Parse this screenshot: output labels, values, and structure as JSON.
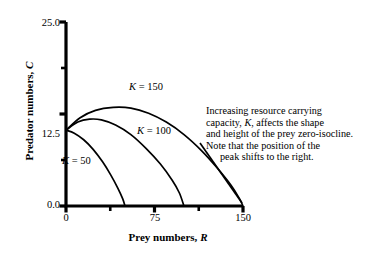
{
  "chart_data": {
    "type": "line",
    "title": "",
    "xlabel": "Prey numbers, R",
    "ylabel": "Predator numbers, C",
    "xlim": [
      0,
      150
    ],
    "ylim": [
      0,
      25.0
    ],
    "grid": false,
    "legend_position": "inline-curve-labels",
    "x_ticks": [
      0,
      37.5,
      75,
      112.5,
      150
    ],
    "x_tick_labels": [
      "0",
      "",
      "75",
      "",
      "150"
    ],
    "y_ticks": [
      0.0,
      6.25,
      12.5,
      18.75,
      25.0
    ],
    "y_tick_labels": [
      "0.0",
      "",
      "12.5",
      "",
      "25.0"
    ],
    "y_intercept": 10.3,
    "series": [
      {
        "name": "K = 50",
        "label": "K = 50",
        "K": 50,
        "x_intercept": 50,
        "peak_x": 0,
        "peak_y": 10.3,
        "points": [
          [
            0,
            10.3
          ],
          [
            7,
            9.9
          ],
          [
            15,
            9.0
          ],
          [
            23,
            7.7
          ],
          [
            31,
            6.0
          ],
          [
            38,
            4.2
          ],
          [
            44,
            2.4
          ],
          [
            48,
            1.0
          ],
          [
            50,
            0.0
          ]
        ]
      },
      {
        "name": "K = 100",
        "label": "K = 100",
        "K": 100,
        "x_intercept": 100,
        "peak_x": 25,
        "peak_y": 11.9,
        "points": [
          [
            0,
            10.3
          ],
          [
            10,
            11.4
          ],
          [
            20,
            11.8
          ],
          [
            30,
            11.7
          ],
          [
            42,
            11.0
          ],
          [
            55,
            9.7
          ],
          [
            68,
            7.8
          ],
          [
            80,
            5.7
          ],
          [
            90,
            3.5
          ],
          [
            96,
            1.8
          ],
          [
            100,
            0.0
          ]
        ]
      },
      {
        "name": "K = 150",
        "label": "K = 150",
        "K": 150,
        "x_intercept": 150,
        "peak_x": 50,
        "peak_y": 13.4,
        "points": [
          [
            0,
            10.3
          ],
          [
            12,
            12.0
          ],
          [
            25,
            13.0
          ],
          [
            40,
            13.4
          ],
          [
            55,
            13.3
          ],
          [
            70,
            12.6
          ],
          [
            85,
            11.4
          ],
          [
            100,
            9.7
          ],
          [
            115,
            7.5
          ],
          [
            128,
            5.2
          ],
          [
            140,
            2.8
          ],
          [
            147,
            1.0
          ],
          [
            150,
            0.0
          ]
        ]
      }
    ],
    "curve_labels": [
      {
        "text": "K = 150",
        "symbol": "K",
        "rest": " = 150"
      },
      {
        "text": "K = 100",
        "symbol": "K",
        "rest": " = 100"
      },
      {
        "text": "K = 50",
        "symbol": "K",
        "rest": " = 50"
      }
    ],
    "annotation": {
      "lines": [
        "Increasing resource carrying",
        "capacity, K, affects the shape",
        "and height of the prey zero-isocline.",
        "Note that the position of the",
        "peak shifts to the right."
      ],
      "line2_prefix": "capacity, ",
      "line2_symbol": "K",
      "line2_suffix": ", affects the shape",
      "leader_line_to": [
        150,
        0
      ]
    }
  },
  "axes": {
    "y_title_prefix": "Predator numbers, ",
    "y_title_symbol": "C",
    "x_title_prefix": "Prey numbers, ",
    "x_title_symbol": "R",
    "y_label_top": "25.0",
    "y_label_mid": "12.5",
    "y_label_bottom": "0.0",
    "x_label_left": "0",
    "x_label_mid": "75",
    "x_label_right": "150"
  },
  "caption": {
    "text": ""
  },
  "colors": {
    "axis": "#000000",
    "curve": "#000000",
    "text": "#000000",
    "background": "#ffffff"
  }
}
